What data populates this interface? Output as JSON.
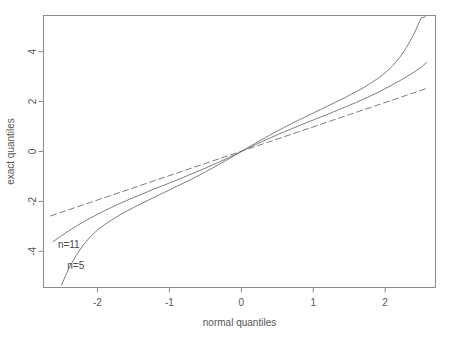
{
  "chart_data": {
    "type": "line",
    "title": "",
    "subtitle": "",
    "xlabel": "normal quantiles",
    "ylabel": "exact quantiles",
    "xlim": [
      -2.75,
      2.7
    ],
    "ylim": [
      -5.45,
      5.45
    ],
    "xticks": [
      -2,
      -1,
      0,
      1,
      2
    ],
    "xtick_labels": [
      "-2",
      "-1",
      "0",
      "1",
      "2"
    ],
    "yticks": [
      -4,
      -2,
      0,
      2,
      4
    ],
    "ytick_labels": [
      "-4",
      "-2",
      "0",
      "2",
      "4"
    ],
    "grid": false,
    "legend_position": "inline-annotations",
    "box": true,
    "series": [
      {
        "name": "n=5",
        "style": "solid",
        "annotation": "n=5",
        "annotation_x": -2.42,
        "annotation_y": -4.7,
        "x": [
          -2.5,
          -2.4,
          -2.3,
          -2.2,
          -2.1,
          -2.0,
          -1.9,
          -1.8,
          -1.7,
          -1.6,
          -1.5,
          -1.4,
          -1.3,
          -1.2,
          -1.1,
          -1.0,
          -0.9,
          -0.8,
          -0.7,
          -0.6,
          -0.5,
          -0.4,
          -0.3,
          -0.2,
          -0.1,
          0.0,
          0.1,
          0.2,
          0.3,
          0.4,
          0.5,
          0.6,
          0.7,
          0.8,
          0.9,
          1.0,
          1.1,
          1.2,
          1.3,
          1.4,
          1.5,
          1.6,
          1.7,
          1.8,
          1.9,
          2.0,
          2.1,
          2.2,
          2.3,
          2.4,
          2.5,
          2.56
        ],
        "y": [
          -5.35,
          -4.7,
          -4.18,
          -3.76,
          -3.42,
          -3.15,
          -2.93,
          -2.74,
          -2.56,
          -2.4,
          -2.25,
          -2.1,
          -1.96,
          -1.82,
          -1.68,
          -1.54,
          -1.4,
          -1.26,
          -1.12,
          -0.97,
          -0.82,
          -0.66,
          -0.5,
          -0.34,
          -0.17,
          0.0,
          0.17,
          0.34,
          0.5,
          0.66,
          0.82,
          0.97,
          1.12,
          1.26,
          1.4,
          1.54,
          1.68,
          1.82,
          1.96,
          2.1,
          2.25,
          2.4,
          2.56,
          2.74,
          2.93,
          3.15,
          3.42,
          3.76,
          4.18,
          4.7,
          5.35,
          5.4
        ]
      },
      {
        "name": "n=11",
        "style": "solid",
        "annotation": "n=11",
        "annotation_x": -2.55,
        "annotation_y": -3.85,
        "x": [
          -2.62,
          -2.5,
          -2.4,
          -2.3,
          -2.2,
          -2.1,
          -2.0,
          -1.9,
          -1.8,
          -1.7,
          -1.6,
          -1.5,
          -1.4,
          -1.3,
          -1.2,
          -1.1,
          -1.0,
          -0.9,
          -0.8,
          -0.7,
          -0.6,
          -0.5,
          -0.4,
          -0.3,
          -0.2,
          -0.1,
          0.0,
          0.1,
          0.2,
          0.3,
          0.4,
          0.5,
          0.6,
          0.7,
          0.8,
          0.9,
          1.0,
          1.1,
          1.2,
          1.3,
          1.4,
          1.5,
          1.6,
          1.7,
          1.8,
          1.9,
          2.0,
          2.1,
          2.2,
          2.3,
          2.4,
          2.5,
          2.58
        ],
        "y": [
          -3.62,
          -3.37,
          -3.18,
          -3.0,
          -2.83,
          -2.67,
          -2.52,
          -2.37,
          -2.23,
          -2.1,
          -1.97,
          -1.85,
          -1.73,
          -1.61,
          -1.49,
          -1.38,
          -1.26,
          -1.15,
          -1.03,
          -0.91,
          -0.79,
          -0.67,
          -0.54,
          -0.41,
          -0.28,
          -0.14,
          0.0,
          0.14,
          0.28,
          0.41,
          0.54,
          0.67,
          0.79,
          0.91,
          1.03,
          1.15,
          1.26,
          1.38,
          1.49,
          1.61,
          1.73,
          1.85,
          1.97,
          2.1,
          2.23,
          2.37,
          2.52,
          2.67,
          2.83,
          3.0,
          3.18,
          3.37,
          3.58
        ]
      },
      {
        "name": "reference",
        "style": "dashed",
        "annotation": "",
        "x": [
          -2.65,
          2.6
        ],
        "y": [
          -2.58,
          2.55
        ]
      }
    ]
  },
  "figure": {
    "background_color": "#ffffff",
    "axis_color": "#8a8a8a",
    "line_color": "#6f6f6f",
    "text_color": "#555555"
  }
}
